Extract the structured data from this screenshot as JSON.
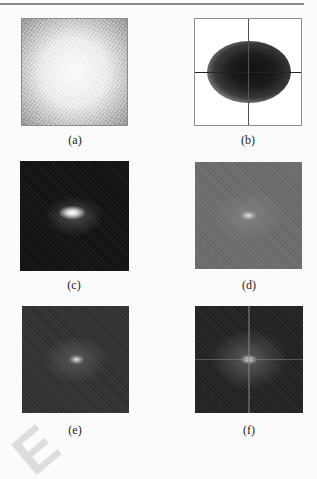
{
  "figure": {
    "panels": [
      {
        "id": "a",
        "caption": "(a)",
        "description": "noise image, lighter center, darker corners"
      },
      {
        "id": "b",
        "caption": "(b)",
        "description": "scatter plot of dense point cloud with crosshair axes"
      },
      {
        "id": "c",
        "caption": "(c)",
        "description": "dark spectrum with bright central blob"
      },
      {
        "id": "d",
        "caption": "(d)",
        "description": "mid-gray spectrum with faint central peak"
      },
      {
        "id": "e",
        "caption": "(e)",
        "description": "dark gray spectrum with central peak"
      },
      {
        "id": "f",
        "caption": "(f)",
        "description": "dark spectrum with central peak and faint cross lines"
      }
    ]
  },
  "watermark": {
    "text": "E"
  },
  "colors": {
    "rule": "#8a8a8a",
    "background": "#fbfbfb",
    "caption_text": "#222222"
  }
}
